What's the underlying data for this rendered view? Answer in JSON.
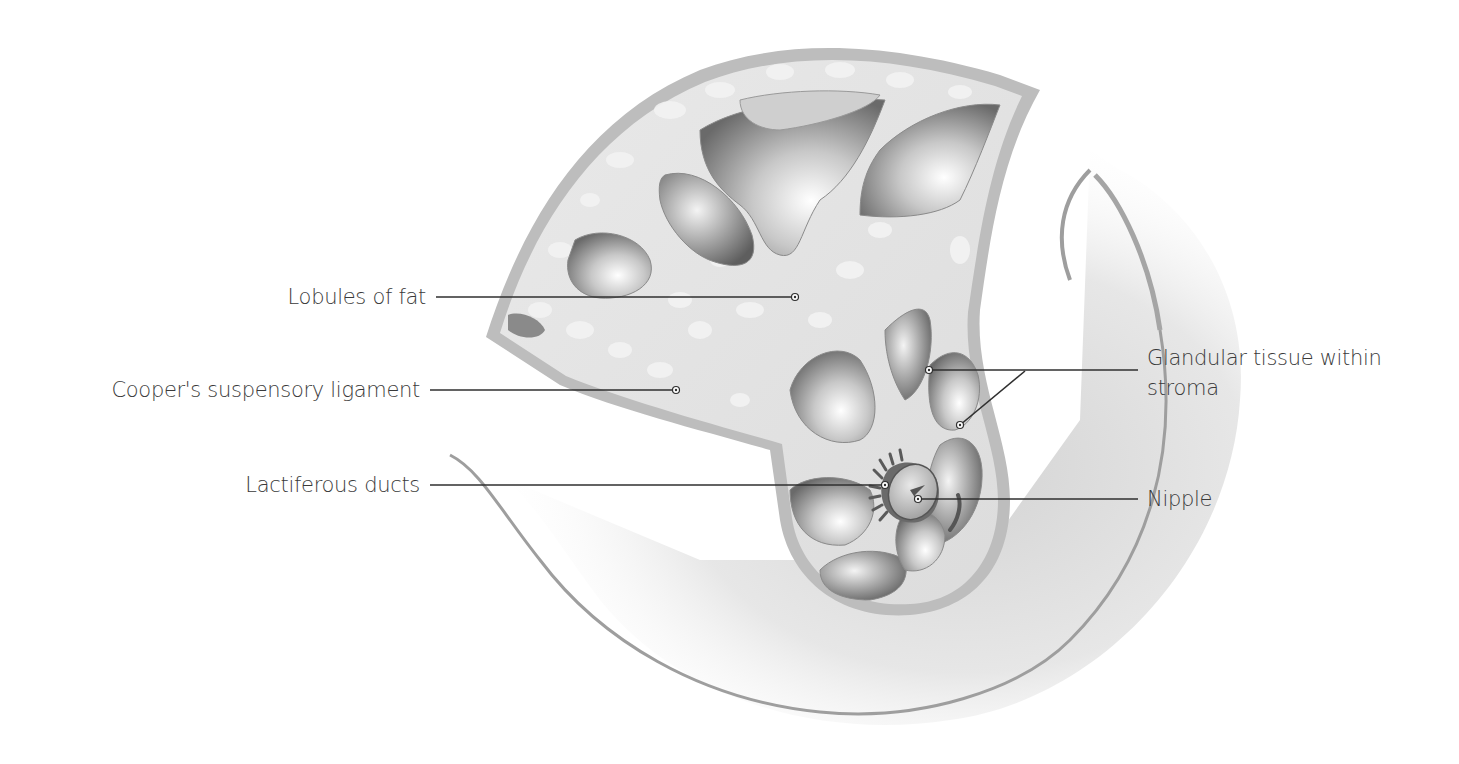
{
  "diagram": {
    "colors": {
      "background": "#ffffff",
      "skin_outline": "#a8a8a8",
      "tissue_fill": "#e2e2e2",
      "body_shadow": "#d6d6d6",
      "leader_line": "#2f2f2f",
      "label_text": "#3a3a3a"
    },
    "labels": [
      {
        "id": "lobules-of-fat",
        "text": "Lobules of fat",
        "side": "left",
        "text_right_x": 426,
        "y": 297,
        "line": [
          [
            436,
            297
          ],
          [
            795,
            297
          ]
        ]
      },
      {
        "id": "coopers-ligament",
        "text": "Cooper's suspensory ligament",
        "side": "left",
        "text_right_x": 420,
        "y": 390,
        "line": [
          [
            430,
            390
          ],
          [
            676,
            390
          ]
        ]
      },
      {
        "id": "lactiferous-ducts",
        "text": "Lactiferous ducts",
        "side": "left",
        "text_right_x": 420,
        "y": 485,
        "line": [
          [
            430,
            485
          ],
          [
            885,
            485
          ]
        ]
      },
      {
        "id": "glandular-tissue",
        "text_line1": "Glandular tissue within",
        "text_line2": "stroma",
        "side": "right",
        "text_left_x": 1147,
        "y": 370,
        "line": [
          [
            1138,
            370
          ],
          [
            929,
            370
          ]
        ],
        "branch": [
          [
            1025,
            371
          ],
          [
            960,
            425
          ]
        ]
      },
      {
        "id": "nipple",
        "text": "Nipple",
        "side": "right",
        "text_left_x": 1147,
        "y": 499,
        "line": [
          [
            1138,
            499
          ],
          [
            918,
            499
          ]
        ]
      }
    ]
  }
}
